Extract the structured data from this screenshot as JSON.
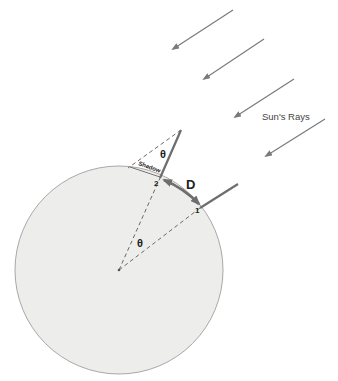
{
  "diagram": {
    "labels": {
      "sun_rays": "Sun's Rays",
      "distance": "D",
      "angle_top": "θ",
      "angle_center": "θ",
      "shadow": "Shadow",
      "point_1": "1",
      "point_2": "2"
    },
    "colors": {
      "earth_fill": "#ededeb",
      "earth_stroke": "#a8a8a8",
      "ray": "#7a7a7a",
      "stick": "#6e6e6e",
      "dashed": "#6a6a6a",
      "text": "#222222",
      "arc": "#6e6e6e"
    },
    "sun_rays": [
      {
        "x1": 233,
        "y1": 10,
        "x2": 173,
        "y2": 49
      },
      {
        "x1": 264,
        "y1": 39,
        "x2": 204,
        "y2": 79
      },
      {
        "x1": 294,
        "y1": 79,
        "x2": 235,
        "y2": 117
      },
      {
        "x1": 325,
        "y1": 119,
        "x2": 266,
        "y2": 156
      }
    ],
    "earth": {
      "cx": 119,
      "cy": 270,
      "r": 104
    }
  }
}
